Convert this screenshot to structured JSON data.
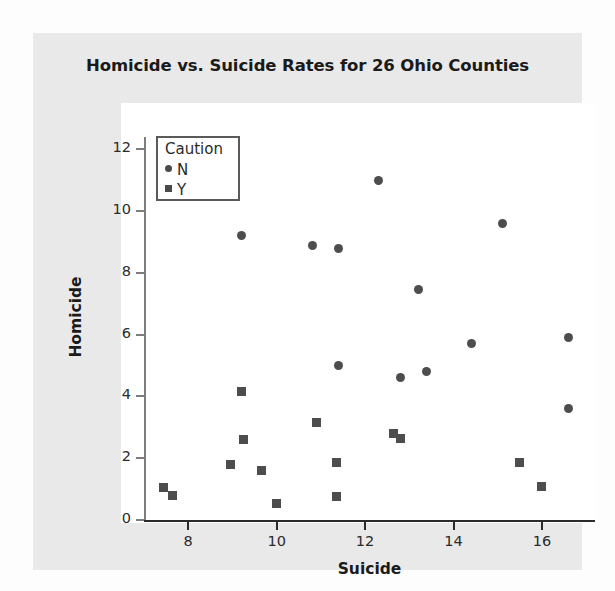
{
  "chart_data": {
    "type": "scatter",
    "title": "Homicide vs. Suicide Rates for 26 Ohio Counties",
    "xlabel": "Suicide",
    "ylabel": "Homicide",
    "xlim": [
      7.0,
      17.2
    ],
    "ylim": [
      0,
      12.4
    ],
    "xticks": [
      8,
      10,
      12,
      14,
      16
    ],
    "xtick_labels": [
      "8",
      "10",
      "12",
      "14",
      "16"
    ],
    "yticks": [
      0,
      2,
      4,
      6,
      8,
      10,
      12
    ],
    "ytick_labels": [
      "0",
      "2",
      "4",
      "6",
      "8",
      "10",
      "12"
    ],
    "grid": false,
    "legend": {
      "title": "Caution",
      "position": "top-left",
      "entries": [
        {
          "label": "N",
          "marker": "circle",
          "color": "#4d4d4d"
        },
        {
          "label": "Y",
          "marker": "square",
          "color": "#4d4d4d"
        }
      ]
    },
    "series": [
      {
        "name": "N",
        "marker": "circle",
        "color": "#4d4d4d",
        "points": [
          {
            "x": 9.2,
            "y": 9.2
          },
          {
            "x": 10.8,
            "y": 8.9
          },
          {
            "x": 11.4,
            "y": 8.8
          },
          {
            "x": 12.3,
            "y": 11.0
          },
          {
            "x": 15.1,
            "y": 9.6
          },
          {
            "x": 13.2,
            "y": 7.45
          },
          {
            "x": 14.4,
            "y": 5.7
          },
          {
            "x": 16.6,
            "y": 5.9
          },
          {
            "x": 11.4,
            "y": 5.0
          },
          {
            "x": 12.8,
            "y": 4.6
          },
          {
            "x": 13.4,
            "y": 4.8
          },
          {
            "x": 16.6,
            "y": 3.6
          }
        ]
      },
      {
        "name": "Y",
        "marker": "square",
        "color": "#4d4d4d",
        "points": [
          {
            "x": 9.2,
            "y": 4.15
          },
          {
            "x": 10.9,
            "y": 3.15
          },
          {
            "x": 9.25,
            "y": 2.6
          },
          {
            "x": 12.65,
            "y": 2.8
          },
          {
            "x": 12.8,
            "y": 2.65
          },
          {
            "x": 8.95,
            "y": 1.8
          },
          {
            "x": 9.65,
            "y": 1.6
          },
          {
            "x": 11.35,
            "y": 1.85
          },
          {
            "x": 15.5,
            "y": 1.85
          },
          {
            "x": 16.0,
            "y": 1.1
          },
          {
            "x": 7.45,
            "y": 1.05
          },
          {
            "x": 7.65,
            "y": 0.8
          },
          {
            "x": 11.35,
            "y": 0.75
          },
          {
            "x": 10.0,
            "y": 0.55
          }
        ]
      }
    ]
  },
  "colors": {
    "figure_background": "#e9e9e9",
    "panel_background": "#ffffff",
    "marker": "#4d4d4d",
    "axis": "#2b2b2b",
    "text": "#1a1a1a"
  }
}
